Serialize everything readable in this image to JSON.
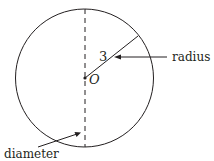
{
  "diagram": {
    "center_label": "O",
    "radius_value": "3",
    "radius_label": "radius",
    "diameter_label": "diameter",
    "stroke_color": "#231f20"
  }
}
